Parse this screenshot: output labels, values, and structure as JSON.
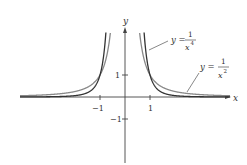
{
  "chart_data": {
    "type": "line",
    "title": "",
    "xlabel": "x",
    "ylabel": "y",
    "x_ticks": [
      "-1",
      "1"
    ],
    "y_ticks": [
      "1",
      "-1"
    ],
    "xlim": [
      -4.2,
      4.2
    ],
    "ylim": [
      -3,
      3
    ],
    "grid": false,
    "legend": "none",
    "series": [
      {
        "name": "y = 1/x^2",
        "function": "1/x^2",
        "color": "#888888"
      },
      {
        "name": "y = 1/x^4",
        "function": "1/x^4",
        "color": "#333333"
      }
    ],
    "annotations": [
      {
        "text": "y = 1/x^4",
        "points_to": "1/x^4 curve near x=0.9"
      },
      {
        "text": "y = 1/x^2",
        "points_to": "1/x^2 curve near x=2"
      }
    ]
  },
  "labels": {
    "x_axis": "x",
    "y_axis": "y",
    "tick_x_neg1": "−1",
    "tick_x_pos1": "1",
    "tick_y_pos1": "1",
    "tick_y_neg1": "−1",
    "ann4_y": "y =",
    "ann4_num": "1",
    "ann4_den": "x",
    "ann4_exp": "4",
    "ann2_y": "y =",
    "ann2_num": "1",
    "ann2_den": "x",
    "ann2_exp": "2"
  }
}
